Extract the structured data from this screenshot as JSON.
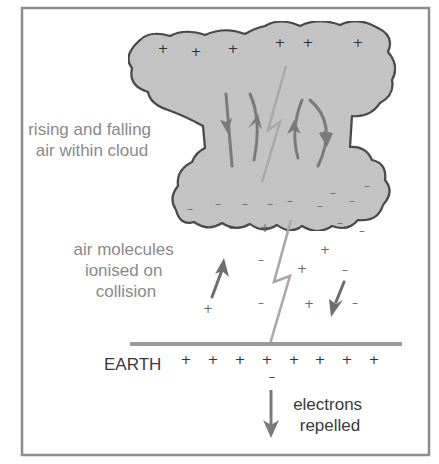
{
  "diagram": {
    "labels": {
      "cloud_air": [
        "rising and falling",
        "air within cloud"
      ],
      "ionised": [
        "air molecules",
        "ionised on",
        "collision"
      ],
      "earth": "EARTH",
      "electrons": [
        "electrons",
        "repelled"
      ]
    },
    "symbols": {
      "plus": "+",
      "minus": "–"
    },
    "colors": {
      "cloud_fill": "#c4c4c4",
      "cloud_outline": "#2e2e2e",
      "arrow": "#7a7a7a",
      "lightning": "#a8a8a8",
      "ground": "#9a9a9a",
      "frame": "#8c8c8c",
      "label_grey": "#8a8a8a",
      "label_dark": "#3a3a3a"
    },
    "cloud_top_charges": [
      {
        "x": 163,
        "y": 53
      },
      {
        "x": 196,
        "y": 56
      },
      {
        "x": 233,
        "y": 53
      },
      {
        "x": 280,
        "y": 47
      },
      {
        "x": 308,
        "y": 47
      },
      {
        "x": 358,
        "y": 47
      }
    ],
    "cloud_bottom_charges": [
      {
        "x": 190,
        "y": 213
      },
      {
        "x": 218,
        "y": 208
      },
      {
        "x": 245,
        "y": 208
      },
      {
        "x": 270,
        "y": 208
      },
      {
        "x": 290,
        "y": 205
      },
      {
        "x": 320,
        "y": 210
      },
      {
        "x": 333,
        "y": 197
      },
      {
        "x": 352,
        "y": 205
      },
      {
        "x": 367,
        "y": 190
      },
      {
        "x": 340,
        "y": 227
      }
    ],
    "air_charges": [
      {
        "sign": "minus",
        "x": 232,
        "y": 232
      },
      {
        "sign": "plus",
        "x": 265,
        "y": 232
      },
      {
        "sign": "minus",
        "x": 362,
        "y": 235
      },
      {
        "sign": "plus",
        "x": 325,
        "y": 254
      },
      {
        "sign": "minus",
        "x": 261,
        "y": 264
      },
      {
        "sign": "plus",
        "x": 302,
        "y": 273
      },
      {
        "sign": "minus",
        "x": 345,
        "y": 274
      },
      {
        "sign": "plus",
        "x": 208,
        "y": 313
      },
      {
        "sign": "minus",
        "x": 261,
        "y": 307
      },
      {
        "sign": "plus",
        "x": 309,
        "y": 308
      },
      {
        "sign": "minus",
        "x": 355,
        "y": 307
      }
    ],
    "earth_charges": [
      {
        "x": 186,
        "y": 364
      },
      {
        "x": 213,
        "y": 364
      },
      {
        "x": 240,
        "y": 364
      },
      {
        "x": 267,
        "y": 364
      },
      {
        "x": 294,
        "y": 364
      },
      {
        "x": 320,
        "y": 364
      },
      {
        "x": 347,
        "y": 364
      },
      {
        "x": 374,
        "y": 364
      }
    ],
    "electron_minus": {
      "x": 272,
      "y": 381
    }
  }
}
